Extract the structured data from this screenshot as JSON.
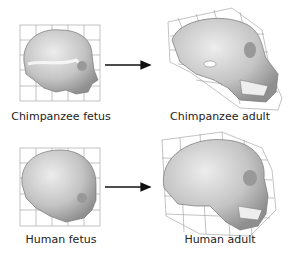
{
  "figure": {
    "panels": [
      {
        "id": "chimp-fetus",
        "label": "Chimpanzee fetus"
      },
      {
        "id": "chimp-adult",
        "label": "Chimpanzee adult"
      },
      {
        "id": "human-fetus",
        "label": "Human fetus"
      },
      {
        "id": "human-adult",
        "label": "Human adult"
      }
    ],
    "arrows": [
      {
        "from": "chimp-fetus",
        "to": "chimp-adult"
      },
      {
        "from": "human-fetus",
        "to": "human-adult"
      }
    ],
    "colors": {
      "grid": "#9a9a9a",
      "skull": "#c9c9c9",
      "skull_dark": "#8e8e8e",
      "arrow": "#111111"
    }
  }
}
